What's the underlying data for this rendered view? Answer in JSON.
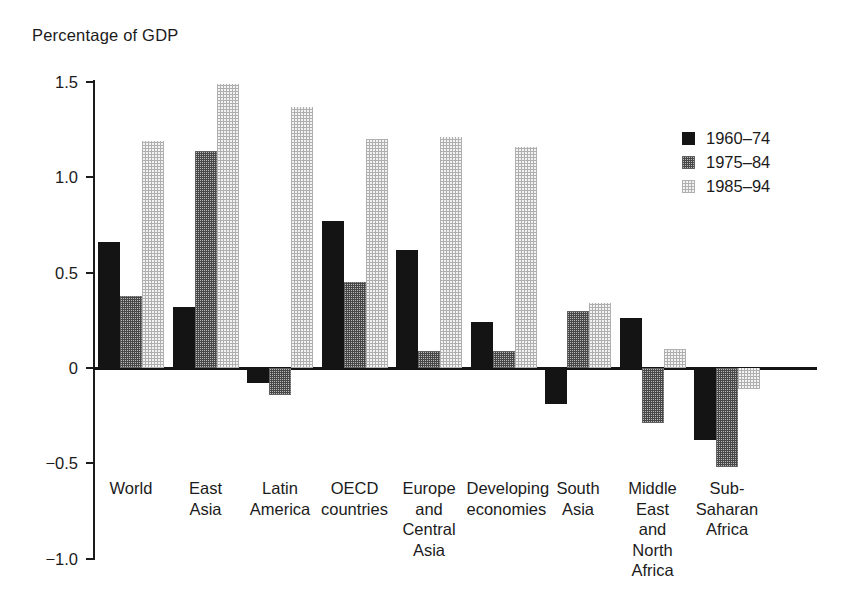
{
  "chart_data": {
    "type": "bar",
    "title": "Percentage of GDP",
    "xlabel": "",
    "ylabel": "Percentage of GDP",
    "ylim": [
      -1.0,
      1.5
    ],
    "yticks": [
      "1.5",
      "1.0",
      "0.5",
      "0",
      "−0.5",
      "−1.0"
    ],
    "ytick_values": [
      1.5,
      1.0,
      0.5,
      0,
      -0.5,
      -1.0
    ],
    "grid": false,
    "legend_position": "upper right",
    "categories": [
      "World",
      "East\nAsia",
      "Latin\nAmerica",
      "OECD\ncountries",
      "Europe\nand\nCentral\nAsia",
      "Developing\neconomies",
      "South\nAsia",
      "Middle\nEast\nand\nNorth\nAfrica",
      "Sub-\nSaharan\nAfrica"
    ],
    "series": [
      {
        "name": "1960–74",
        "color": "#141414",
        "pattern": "solid",
        "values": [
          0.66,
          0.32,
          -0.08,
          0.77,
          0.62,
          0.24,
          -0.19,
          0.26,
          -0.38
        ]
      },
      {
        "name": "1975–84",
        "color": "#5a5a5a",
        "pattern": "medium-checker",
        "values": [
          0.38,
          1.14,
          -0.14,
          0.45,
          0.09,
          0.09,
          0.3,
          -0.29,
          -0.52
        ]
      },
      {
        "name": "1985–94",
        "color": "#d0d0d0",
        "pattern": "light-checker",
        "values": [
          1.19,
          1.49,
          1.37,
          1.2,
          1.21,
          1.16,
          0.34,
          0.1,
          -0.11
        ]
      }
    ]
  },
  "legend": {
    "items": [
      {
        "label": "1960–74"
      },
      {
        "label": "1975–84"
      },
      {
        "label": "1985–94"
      }
    ]
  }
}
